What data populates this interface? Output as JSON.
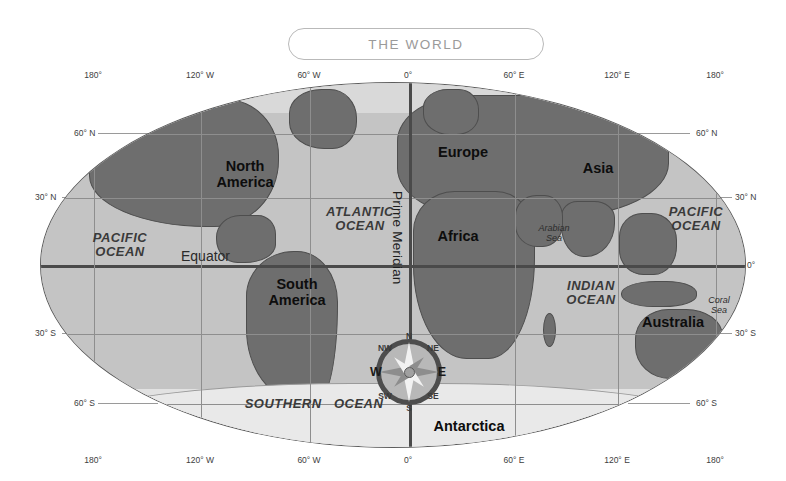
{
  "title": {
    "text": "THE WORLD"
  },
  "map": {
    "projection_label": "world map oval projection",
    "longitude_ticks": [
      {
        "label": "180°",
        "x_pct": 7.5
      },
      {
        "label": "120° W",
        "x_pct": 22.6
      },
      {
        "label": "60° W",
        "x_pct": 38.0
      },
      {
        "label": "0°",
        "x_pct": 52.0
      },
      {
        "label": "60° E",
        "x_pct": 67.0
      },
      {
        "label": "120° E",
        "x_pct": 81.5
      },
      {
        "label": "180°",
        "x_pct": 95.5
      }
    ],
    "latitude_ticks": [
      {
        "label": "60° N",
        "y_pct": 14.0
      },
      {
        "label": "30° N",
        "y_pct": 31.5
      },
      {
        "label": "0°",
        "y_pct": 50.0
      },
      {
        "label": "30° S",
        "y_pct": 68.5
      },
      {
        "label": "60° S",
        "y_pct": 87.5
      }
    ],
    "continents": [
      {
        "name": "north-america",
        "lines": "North\nAmerica"
      },
      {
        "name": "south-america",
        "lines": "South\nAmerica"
      },
      {
        "name": "europe",
        "lines": "Europe"
      },
      {
        "name": "asia",
        "lines": "Asia"
      },
      {
        "name": "africa",
        "lines": "Africa"
      },
      {
        "name": "australia",
        "lines": "Australia"
      },
      {
        "name": "new-zealand",
        "lines": "New\nZealand"
      },
      {
        "name": "antarctica",
        "lines": "Antarctica"
      }
    ],
    "oceans": [
      {
        "name": "arctic-ocean-west",
        "lines": "ARCTIC\nOCEAN"
      },
      {
        "name": "arctic-ocean-east",
        "lines": "ARCTIC OCEAN"
      },
      {
        "name": "pacific-ocean-west",
        "lines": "PACIFIC\nOCEAN"
      },
      {
        "name": "pacific-ocean-east",
        "lines": "PACIFIC\nOCEAN"
      },
      {
        "name": "atlantic-ocean",
        "lines": "ATLANTIC\nOCEAN"
      },
      {
        "name": "indian-ocean",
        "lines": "INDIAN\nOCEAN"
      },
      {
        "name": "southern-ocean",
        "lines": "SOUTHERN   OCEAN"
      }
    ],
    "seas": [
      {
        "name": "arabian-sea",
        "lines": "Arabian\nSea"
      },
      {
        "name": "coral-sea",
        "lines": "Coral\nSea"
      }
    ],
    "reference_lines": {
      "equator": "Equator",
      "prime_meridian": "Prime Meridian"
    },
    "compass": {
      "north": "N",
      "east": "E",
      "south": "S",
      "west": "W",
      "northeast": "NE",
      "northwest": "NW",
      "southeast": "SE",
      "southwest": "SW"
    },
    "colors": {
      "land": "#6e6e6e",
      "ocean": "#c4c4c4",
      "polar_ice": "#e9e9e9",
      "graticule_major": "#4a4a4a",
      "graticule_minor": "#8e8e8e",
      "title_border": "#b9b9b9",
      "title_text": "#9a9a9a"
    }
  }
}
